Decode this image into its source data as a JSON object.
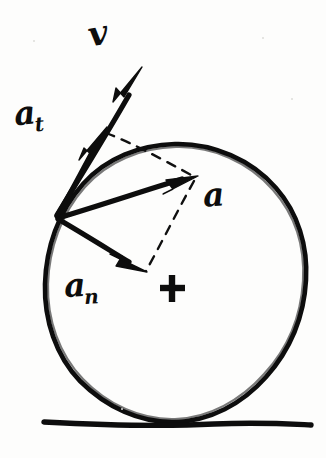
{
  "figure": {
    "background_color": "#fdfdfc",
    "ink_color": "#0d0d0d"
  },
  "labels": {
    "velocity": "v",
    "tangential_base": "a",
    "tangential_sub": "t",
    "normal_base": "a",
    "normal_sub": "n",
    "resultant": "a"
  },
  "shapes": {
    "circle": {
      "name": "wheel",
      "center_x": 175,
      "center_y": 282,
      "radius": 140
    },
    "ground": {
      "name": "ground-line",
      "x1": 44,
      "y1": 423,
      "x2": 311,
      "y2": 425
    },
    "center_mark": {
      "name": "center-cross",
      "x": 172,
      "y": 288,
      "size": 12
    }
  },
  "vectors": [
    {
      "name": "velocity-vector",
      "label": "v",
      "origin_x": 57,
      "origin_y": 217,
      "tip_x": 141,
      "tip_y": 68,
      "style": "solid-arrow"
    },
    {
      "name": "tangential-acceleration-vector",
      "label": "a_t",
      "origin_x": 57,
      "origin_y": 217,
      "tip_x": 104,
      "tip_y": 130,
      "style": "solid-arrow"
    },
    {
      "name": "resultant-acceleration-vector",
      "label": "a",
      "origin_x": 57,
      "origin_y": 217,
      "tip_x": 196,
      "tip_y": 177,
      "style": "solid-arrow"
    },
    {
      "name": "normal-acceleration-vector",
      "label": "a_n",
      "origin_x": 57,
      "origin_y": 217,
      "tip_x": 144,
      "tip_y": 270,
      "style": "solid-arrow"
    }
  ],
  "construction_lines": [
    {
      "name": "dashed-parallel-to-resultant",
      "x1": 104,
      "y1": 132,
      "x2": 196,
      "y2": 177
    },
    {
      "name": "dashed-resultant-to-center",
      "x1": 193,
      "y1": 180,
      "x2": 145,
      "y2": 272
    }
  ]
}
